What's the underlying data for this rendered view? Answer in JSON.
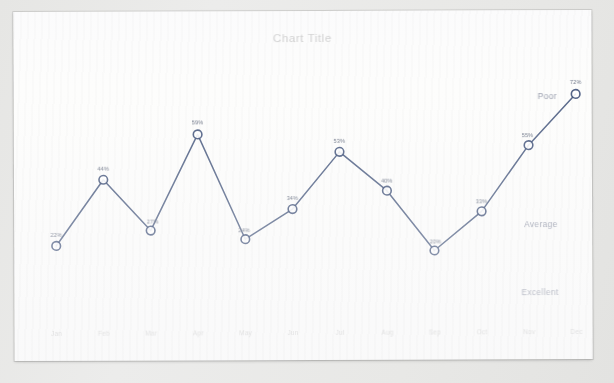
{
  "chart_data": {
    "type": "line",
    "title": "Chart Title",
    "xlabel": "",
    "ylabel": "",
    "ylim": [
      0,
      80
    ],
    "grid": false,
    "legend_position": "none",
    "categories": [
      "Jan",
      "Feb",
      "Mar",
      "Apr",
      "May",
      "Jun",
      "Jul",
      "Aug",
      "Sep",
      "Oct",
      "Nov",
      "Dec"
    ],
    "values": [
      22,
      44,
      27,
      59,
      24,
      34,
      53,
      40,
      20,
      33,
      55,
      72
    ],
    "data_labels": [
      "22%",
      "44%",
      "27%",
      "59%",
      "24%",
      "34%",
      "53%",
      "40%",
      "20%",
      "33%",
      "55%",
      "72%"
    ],
    "series": [
      {
        "name": "Series 1",
        "values": [
          22,
          44,
          27,
          59,
          24,
          34,
          53,
          40,
          20,
          33,
          55,
          72
        ]
      }
    ],
    "annotations": [
      {
        "text": "Poor",
        "position": "right-top"
      },
      {
        "text": "Average",
        "position": "right-middle"
      },
      {
        "text": "Excellent",
        "position": "right-bottom"
      }
    ],
    "colors": {
      "line": "#41537a",
      "marker_fill": "#ffffff",
      "marker_stroke": "#41537a",
      "title": "#b9b9b8",
      "tick_label": "#d2d2d1",
      "data_label": "#6c7486",
      "annotation": "#9a9fae",
      "paper": "#fdfdfc",
      "background": "#e9e9e7"
    }
  },
  "zones": {
    "poor": "Poor",
    "average": "Average",
    "excellent": "Excellent"
  }
}
